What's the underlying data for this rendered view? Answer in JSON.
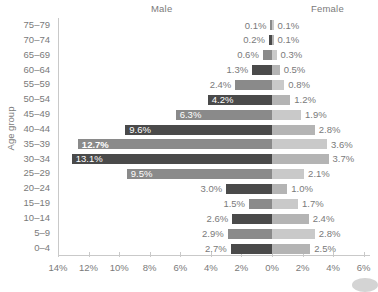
{
  "header": {
    "male_label": "Male",
    "female_label": "Female"
  },
  "axes": {
    "y_title": "Age group",
    "x_tick_labels": [
      "14%",
      "12%",
      "10%",
      "8%",
      "6%",
      "4%",
      "2%",
      "0%",
      "2%",
      "4%",
      "6%"
    ],
    "x_tick_values": [
      14,
      12,
      10,
      8,
      6,
      4,
      2,
      0,
      2,
      4,
      6
    ]
  },
  "colors": {
    "bar_dark": "#4a4a4a",
    "bar_medium": "#8a8a8a",
    "bar_female_light": "#b4b4b4",
    "bar_female_lighter": "#c9c9c9",
    "axis": "#c9c9c9",
    "text": "#7a7a7a",
    "text_bold": "#2f2f2f"
  },
  "chart_data": {
    "type": "bar",
    "subtype": "population-pyramid",
    "title": "",
    "xlabel": "",
    "ylabel": "Age group",
    "categories": [
      "75–79",
      "70–74",
      "65–69",
      "60–64",
      "55–59",
      "50–54",
      "45–49",
      "40–44",
      "35–39",
      "30–34",
      "25–29",
      "20–24",
      "15–19",
      "10–14",
      "5–9",
      "0–4"
    ],
    "series": [
      {
        "name": "Male",
        "direction": "left",
        "values": [
          0.1,
          0.2,
          0.6,
          1.3,
          2.4,
          4.2,
          6.3,
          9.6,
          12.7,
          13.1,
          9.5,
          3.0,
          1.5,
          2.6,
          2.9,
          2.7
        ],
        "labels": [
          "0.1%",
          "0.2%",
          "0.6%",
          "1.3%",
          "2.4%",
          "4.2%",
          "6.3%",
          "9.6%",
          "12.7%",
          "13.1%",
          "9.5%",
          "3.0%",
          "1.5%",
          "2.6%",
          "2.9%",
          "2.7%"
        ]
      },
      {
        "name": "Female",
        "direction": "right",
        "values": [
          0.1,
          0.1,
          0.3,
          0.5,
          0.8,
          1.2,
          1.9,
          2.8,
          3.6,
          3.7,
          2.1,
          1.0,
          1.7,
          2.4,
          2.8,
          2.5
        ],
        "labels": [
          "0.1%",
          "0.1%",
          "0.3%",
          "0.5%",
          "0.8%",
          "1.2%",
          "1.9%",
          "2.8%",
          "3.6%",
          "3.7%",
          "2.1%",
          "1.0%",
          "1.7%",
          "2.4%",
          "2.8%",
          "2.5%"
        ]
      }
    ],
    "xlim_left": 14,
    "xlim_right": 6,
    "grid": false,
    "legend_position": "top",
    "highlighted": [
      {
        "category": "35–39",
        "series": "Male",
        "label": "12.7%"
      }
    ]
  }
}
